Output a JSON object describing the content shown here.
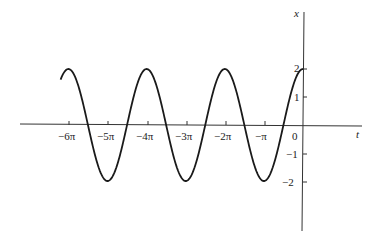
{
  "chart_data": {
    "type": "line",
    "title": "",
    "xlabel": "t",
    "ylabel": "x",
    "function": "x = 2cos(t)",
    "x_ticks": [
      "−6π",
      "−5π",
      "−4π",
      "−3π",
      "−2π",
      "−π",
      "0"
    ],
    "y_ticks": [
      "2",
      "1",
      "−1",
      "−2"
    ],
    "xlim": [
      -6.2,
      0
    ],
    "ylim": [
      -2,
      2
    ],
    "series": [
      {
        "name": "x(t)",
        "x": [
          "-6.2π",
          "-6π",
          "-5.5π",
          "-5π",
          "-4.5π",
          "-4π",
          "-3.5π",
          "-3π",
          "-2.5π",
          "-2π",
          "-1.5π",
          "-π",
          "-0.5π",
          "0"
        ],
        "values": [
          1.62,
          2,
          0,
          -2,
          0,
          2,
          0,
          -2,
          0,
          2,
          0,
          -2,
          0,
          2
        ]
      }
    ],
    "grid": false,
    "legend": null
  }
}
